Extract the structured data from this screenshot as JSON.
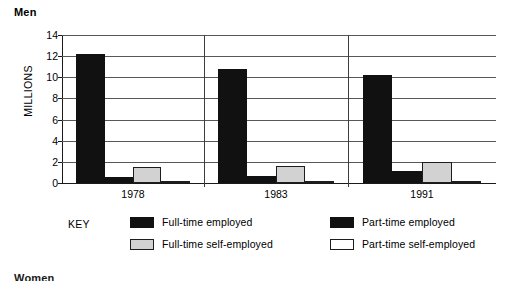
{
  "chart_data": {
    "type": "bar",
    "title": "Men",
    "xlabel": "",
    "ylabel": "MILLIONS",
    "categories": [
      "1978",
      "1983",
      "1991"
    ],
    "ylim": [
      0,
      14
    ],
    "yticks": [
      0,
      2,
      4,
      6,
      8,
      10,
      12,
      14
    ],
    "grid": true,
    "legend_position": "below",
    "legend_label": "KEY",
    "series": [
      {
        "name": "Full-time employed",
        "color": "#111111",
        "values": [
          12.2,
          10.8,
          10.2
        ]
      },
      {
        "name": "Part-time employed",
        "color": "#111111",
        "values": [
          0.6,
          0.7,
          1.1
        ]
      },
      {
        "name": "Full-time self-employed",
        "color": "#d2d2d2",
        "values": [
          1.5,
          1.6,
          2.0
        ]
      },
      {
        "name": "Part-time self-employed",
        "color": "#ffffff",
        "values": [
          0.1,
          0.15,
          0.15
        ]
      }
    ]
  },
  "page": {
    "next_section_title": "Women"
  }
}
